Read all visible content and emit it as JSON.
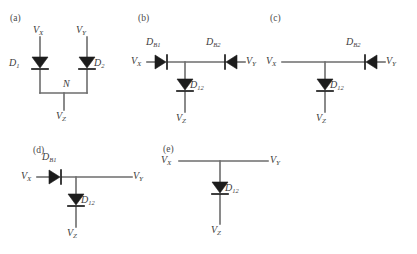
{
  "figure": {
    "kind": "circuit-diagram",
    "width": 417,
    "height": 254,
    "background": "#ffffff",
    "wire_color": "#6d6d6d",
    "diode_color": "#1c1c1c",
    "text_color": "#3c3c3c"
  },
  "panels": [
    {
      "id": "a",
      "letter": "(a)",
      "terminals": {
        "vx": "V",
        "vx_sub": "X",
        "vy": "V",
        "vy_sub": "Y",
        "vz": "V",
        "vz_sub": "Z"
      },
      "node_label": "N",
      "diodes": [
        {
          "name": "D",
          "sub": "1",
          "orientation": "down"
        },
        {
          "name": "D",
          "sub": "2",
          "orientation": "down"
        }
      ]
    },
    {
      "id": "b",
      "letter": "(b)",
      "terminals": {
        "vx": "V",
        "vx_sub": "X",
        "vy": "V",
        "vy_sub": "Y",
        "vz": "V",
        "vz_sub": "Z"
      },
      "diodes": [
        {
          "name": "D",
          "sub": "B1",
          "orientation": "right"
        },
        {
          "name": "D",
          "sub": "B2",
          "orientation": "left"
        },
        {
          "name": "D",
          "sub": "12",
          "orientation": "down"
        }
      ]
    },
    {
      "id": "c",
      "letter": "(c)",
      "terminals": {
        "vx": "V",
        "vx_sub": "X",
        "vy": "V",
        "vy_sub": "Y",
        "vz": "V",
        "vz_sub": "Z"
      },
      "diodes": [
        {
          "name": "D",
          "sub": "B2",
          "orientation": "left"
        },
        {
          "name": "D",
          "sub": "12",
          "orientation": "down"
        }
      ]
    },
    {
      "id": "d",
      "letter": "(d)",
      "terminals": {
        "vx": "V",
        "vx_sub": "X",
        "vy": "V",
        "vy_sub": "Y",
        "vz": "V",
        "vz_sub": "Z"
      },
      "diodes": [
        {
          "name": "D",
          "sub": "B1",
          "orientation": "right"
        },
        {
          "name": "D",
          "sub": "12",
          "orientation": "down"
        }
      ]
    },
    {
      "id": "e",
      "letter": "(e)",
      "terminals": {
        "vx": "V",
        "vx_sub": "X",
        "vy": "V",
        "vy_sub": "Y",
        "vz": "V",
        "vz_sub": "Z"
      },
      "diodes": [
        {
          "name": "D",
          "sub": "12",
          "orientation": "down"
        }
      ]
    }
  ],
  "labels": {
    "panel_a_letter": "(a)",
    "panel_b_letter": "(b)",
    "panel_c_letter": "(c)",
    "panel_d_letter": "(d)",
    "panel_e_letter": "(e)",
    "vx": "V",
    "vy": "V",
    "vz": "V",
    "sub_x": "X",
    "sub_y": "Y",
    "sub_z": "Z",
    "node_n": "N",
    "d": "D",
    "sub_1": "1",
    "sub_2": "2",
    "sub_b1": "B1",
    "sub_b2": "B2",
    "sub_12": "12"
  }
}
